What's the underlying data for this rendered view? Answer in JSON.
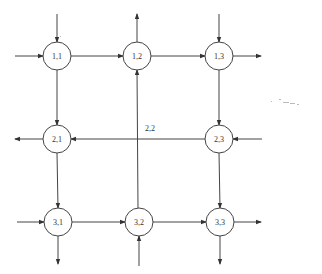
{
  "diagram": {
    "title": "",
    "nodes": [
      {
        "id": "1,1",
        "label": "1,1",
        "x": 57,
        "y": 56
      },
      {
        "id": "1,2",
        "label": "1,2",
        "x": 137,
        "y": 56
      },
      {
        "id": "1,3",
        "label": "1,3",
        "x": 219,
        "y": 56
      },
      {
        "id": "2,1",
        "label": "2,1",
        "x": 57,
        "y": 139
      },
      {
        "id": "2,3",
        "label": "2,3",
        "x": 219,
        "y": 139
      },
      {
        "id": "3,1",
        "label": "3,1",
        "x": 58,
        "y": 222
      },
      {
        "id": "3,2",
        "label": "3,2",
        "x": 139,
        "y": 222
      },
      {
        "id": "3,3",
        "label": "3,3",
        "x": 220,
        "y": 222
      }
    ],
    "free_labels": [
      {
        "id": "2,2",
        "label": "2,2",
        "x": 150,
        "y": 131
      }
    ],
    "edges": [
      {
        "from": "in-top",
        "to": "1,1"
      },
      {
        "from": "in-left",
        "to": "1,1"
      },
      {
        "from": "1,1",
        "to": "1,2"
      },
      {
        "from": "1,2",
        "to": "1,3"
      },
      {
        "from": "1,3",
        "to": "out-right"
      },
      {
        "from": "1,2",
        "to": "out-top"
      },
      {
        "from": "in-top",
        "to": "1,3"
      },
      {
        "from": "1,1",
        "to": "2,1"
      },
      {
        "from": "1,3",
        "to": "2,3"
      },
      {
        "from": "2,3",
        "to": "2,1"
      },
      {
        "from": "in-right",
        "to": "2,3"
      },
      {
        "from": "2,1",
        "to": "out-left"
      },
      {
        "from": "2,1",
        "to": "3,1"
      },
      {
        "from": "2,3",
        "to": "3,3"
      },
      {
        "from": "in-left",
        "to": "3,1"
      },
      {
        "from": "3,1",
        "to": "3,2"
      },
      {
        "from": "3,2",
        "to": "3,3"
      },
      {
        "from": "3,3",
        "to": "out-right"
      },
      {
        "from": "3,1",
        "to": "out-bottom"
      },
      {
        "from": "3,3",
        "to": "out-bottom"
      },
      {
        "from": "in-bottom",
        "to": "3,2"
      },
      {
        "from": "3,2",
        "to": "1,2"
      }
    ]
  }
}
